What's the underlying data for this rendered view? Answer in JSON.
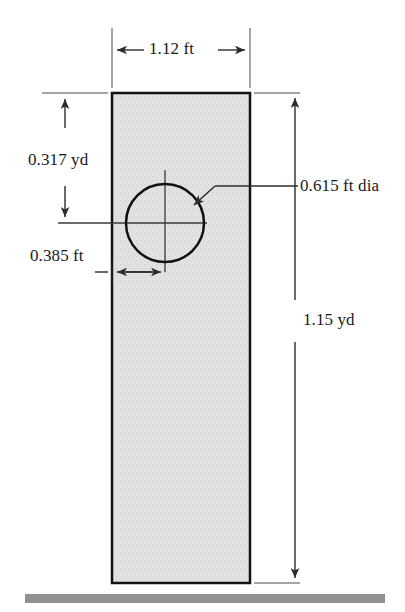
{
  "figure": {
    "colors": {
      "outline": "#111111",
      "fill": "#dedede",
      "ground": "#8f8f8f",
      "dimension_line": "#3a3a3a",
      "text": "#1a1a1a",
      "background": "#ffffff"
    },
    "shapes": {
      "plate": {
        "name": "rectangular-plate",
        "x": 112,
        "y": 93,
        "width": 138,
        "height": 490,
        "fill": "stippled-light-gray",
        "stroke_width": 2.5
      },
      "hole": {
        "name": "circular-hole",
        "center_x": 165,
        "center_y": 223,
        "radius": 39,
        "stroke_width": 2.5
      },
      "ground": {
        "name": "ground-bar",
        "x": 25,
        "y": 594,
        "width": 360,
        "height": 9
      }
    },
    "dimensions": [
      {
        "id": "width",
        "label": "1.12 ft",
        "orientation": "horizontal",
        "value": 1.12,
        "unit": "ft",
        "describes": "plate width",
        "text_x": 149,
        "text_y": 39
      },
      {
        "id": "hole-from-top",
        "label": "0.317 yd",
        "orientation": "vertical",
        "value": 0.317,
        "unit": "yd",
        "describes": "distance from plate top to hole center",
        "text_x": 28,
        "text_y": 150
      },
      {
        "id": "hole-diameter",
        "label": "0.615 ft dia",
        "orientation": "leader",
        "value": 0.615,
        "unit": "ft",
        "describes": "hole diameter",
        "text_x": 300,
        "text_y": 176
      },
      {
        "id": "hole-from-left",
        "label": "0.385 ft",
        "orientation": "horizontal",
        "value": 0.385,
        "unit": "ft",
        "describes": "distance from plate left edge to hole center",
        "text_x": 30,
        "text_y": 246
      },
      {
        "id": "height",
        "label": "1.15 yd",
        "orientation": "vertical",
        "value": 1.15,
        "unit": "yd",
        "describes": "plate height",
        "text_x": 303,
        "text_y": 322
      }
    ]
  }
}
